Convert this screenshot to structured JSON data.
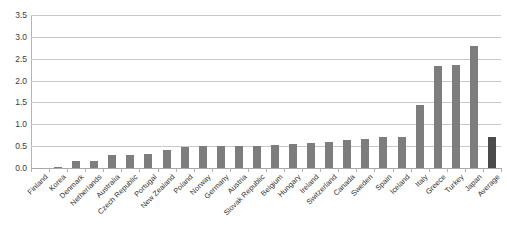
{
  "chart_data": {
    "type": "bar",
    "title": "",
    "subtitle": "",
    "xlabel": "",
    "ylabel": "",
    "ylim": [
      0.0,
      3.5
    ],
    "ytick_values": [
      0.0,
      0.5,
      1.0,
      1.5,
      2.0,
      2.5,
      3.0,
      3.5
    ],
    "ytick_labels": [
      "0.0",
      "0.5",
      "1.0",
      "1.5",
      "2.0",
      "2.5",
      "3.0",
      "3.5"
    ],
    "grid": true,
    "legend": "none",
    "categories": [
      "Finland",
      "Korea",
      "Denmark",
      "Netherlands",
      "Australia",
      "Czech Republic",
      "Portugal",
      "New Zealand",
      "Poland",
      "Norway",
      "Germany",
      "Austria",
      "Slovak Republic",
      "Belgium",
      "Hungary",
      "Ireland",
      "Switzerland",
      "Canada",
      "Sweden",
      "Spain",
      "Iceland",
      "Italy",
      "Greece",
      "Turkey",
      "Japan",
      "Average"
    ],
    "values": [
      0.0,
      0.02,
      0.17,
      0.17,
      0.3,
      0.3,
      0.32,
      0.42,
      0.47,
      0.5,
      0.5,
      0.5,
      0.5,
      0.52,
      0.55,
      0.57,
      0.6,
      0.63,
      0.67,
      0.7,
      0.72,
      1.45,
      2.33,
      2.35,
      2.8,
      0.72
    ],
    "series": [
      {
        "name": "Value",
        "color": "#7d7d7d",
        "highlight_category": "Average",
        "highlight_color": "#4a4a4a",
        "values": [
          0.0,
          0.02,
          0.17,
          0.17,
          0.3,
          0.3,
          0.32,
          0.42,
          0.47,
          0.5,
          0.5,
          0.5,
          0.5,
          0.52,
          0.55,
          0.57,
          0.6,
          0.63,
          0.67,
          0.7,
          0.72,
          1.45,
          2.33,
          2.35,
          2.8,
          0.72
        ]
      }
    ],
    "colors": {
      "bar": "#7d7d7d",
      "bar_highlight": "#4a4a4a",
      "gridline": "#c8c8c8",
      "axis": "#b4b4b4",
      "text": "#2f2f2f",
      "background": "#ffffff"
    }
  }
}
